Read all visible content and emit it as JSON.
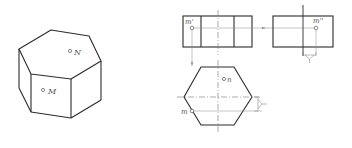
{
  "figure": {
    "iso_view": {
      "point_top": "N",
      "point_front": "M"
    },
    "front_view": {
      "point_label": "m'"
    },
    "side_view": {
      "point_label": "m''"
    },
    "top_view": {
      "point_visible": "n",
      "point_hidden": "m"
    },
    "colors": {
      "line": "#2b2b2b",
      "thin": "#777777",
      "label": "#555555"
    }
  }
}
